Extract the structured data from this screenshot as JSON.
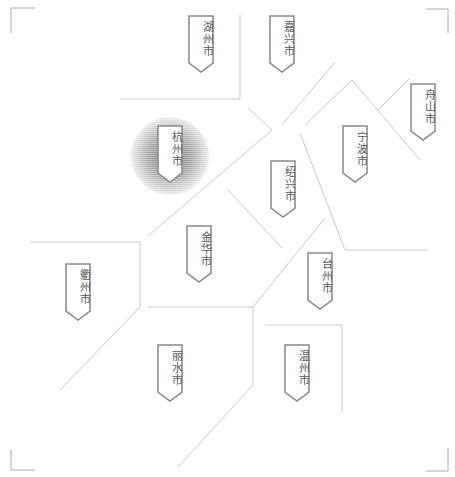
{
  "map": {
    "title": "浙江省地级市分区示意图",
    "line_color": "#c8c8c8",
    "tag_border_color": "#888888",
    "highlight": "杭州市",
    "cities": [
      {
        "name": "湖州市",
        "x": 188,
        "y": 15
      },
      {
        "name": "嘉兴市",
        "x": 269,
        "y": 15
      },
      {
        "name": "舟山市",
        "x": 410,
        "y": 83
      },
      {
        "name": "杭州市",
        "x": 157,
        "y": 125,
        "highlighted": true
      },
      {
        "name": "宁波市",
        "x": 342,
        "y": 125
      },
      {
        "name": "绍兴市",
        "x": 270,
        "y": 160
      },
      {
        "name": "金华市",
        "x": 186,
        "y": 225
      },
      {
        "name": "衢州市",
        "x": 65,
        "y": 263
      },
      {
        "name": "台州市",
        "x": 307,
        "y": 252
      },
      {
        "name": "丽水市",
        "x": 157,
        "y": 344
      },
      {
        "name": "温州市",
        "x": 284,
        "y": 344
      }
    ]
  }
}
